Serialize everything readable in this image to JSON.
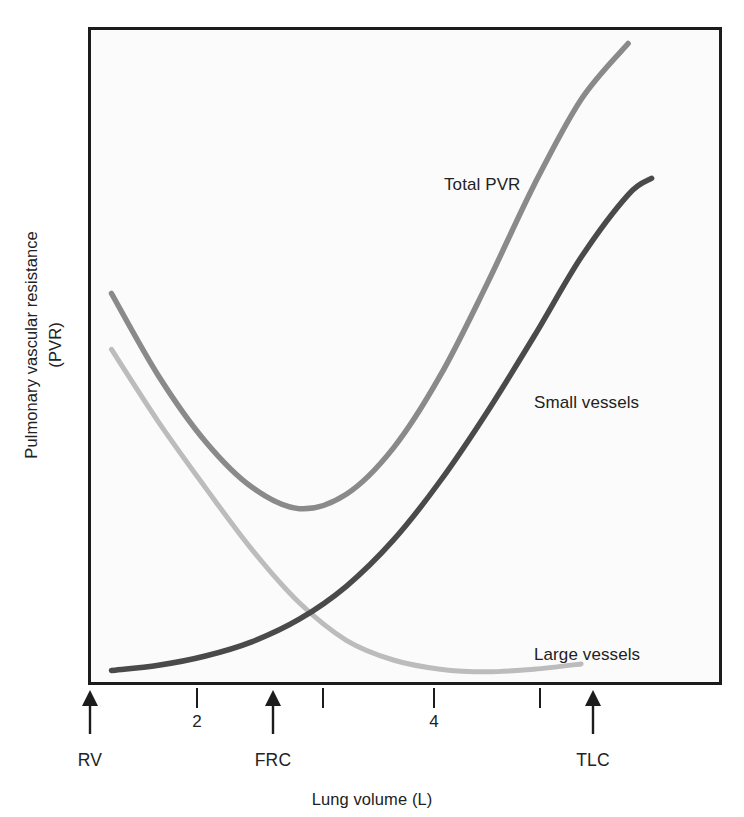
{
  "chart_data": {
    "type": "line",
    "title": "",
    "xlabel": "Lung volume (L)",
    "ylabel": "Pulmonary vascular resistance (PVR)",
    "ylabel_lines": [
      "Pulmonary vascular resistance",
      "(PVR)"
    ],
    "grid": false,
    "legend_position": "inline-annotations",
    "xlim": [
      0.8,
      6.2
    ],
    "ylim": [
      0,
      1
    ],
    "x_axis": {
      "tick_numbers": [
        {
          "label": "2",
          "value": 2
        },
        {
          "label": "4",
          "value": 4
        }
      ],
      "unlabeled_ticks": [
        3,
        5
      ],
      "markers": [
        {
          "label": "RV",
          "value": 1.0
        },
        {
          "label": "FRC",
          "value": 2.6
        },
        {
          "label": "TLC",
          "value": 5.5
        }
      ]
    },
    "y_axis": {
      "ticks": [],
      "note": "qualitative axis, no numeric tick labels"
    },
    "series": [
      {
        "name": "Total PVR",
        "color": "#8a8a8a",
        "label_position": {
          "x": 444,
          "y": 175
        },
        "x": [
          1.0,
          1.4,
          1.8,
          2.2,
          2.6,
          3.0,
          3.4,
          3.8,
          4.2,
          4.6,
          5.0,
          5.4
        ],
        "y": [
          0.595,
          0.47,
          0.37,
          0.3,
          0.268,
          0.29,
          0.36,
          0.47,
          0.61,
          0.76,
          0.89,
          0.975
        ],
        "description": "U-shaped curve, minimum near FRC (~2.7 L), rises steeply toward TLC"
      },
      {
        "name": "Small vessels",
        "color": "#4a4a4a",
        "label_position": {
          "x": 534,
          "y": 393
        },
        "x": [
          1.0,
          1.4,
          1.8,
          2.2,
          2.6,
          3.0,
          3.4,
          3.8,
          4.2,
          4.6,
          5.0,
          5.4,
          5.6
        ],
        "y": [
          0.022,
          0.03,
          0.044,
          0.066,
          0.1,
          0.15,
          0.22,
          0.31,
          0.415,
          0.53,
          0.65,
          0.745,
          0.77
        ],
        "description": "Monotonically increasing from near zero at RV to high value at TLC"
      },
      {
        "name": "Large vessels",
        "color": "#bcbcbc",
        "label_position": {
          "x": 534,
          "y": 645
        },
        "x": [
          1.0,
          1.4,
          1.8,
          2.2,
          2.6,
          3.0,
          3.4,
          3.8,
          4.2,
          4.6,
          5.0
        ],
        "y": [
          0.51,
          0.4,
          0.3,
          0.205,
          0.125,
          0.068,
          0.038,
          0.024,
          0.02,
          0.024,
          0.032
        ],
        "description": "Monotonically decreasing from high value at RV, flattening near baseline past FRC"
      }
    ],
    "annotations": [
      {
        "text": "Total PVR",
        "series": "Total PVR"
      },
      {
        "text": "Small vessels",
        "series": "Small vessels"
      },
      {
        "text": "Large vessels",
        "series": "Large vessels"
      }
    ]
  },
  "figure": {
    "frame_color": "#1c1c1c",
    "background": "#fbfbfb"
  }
}
